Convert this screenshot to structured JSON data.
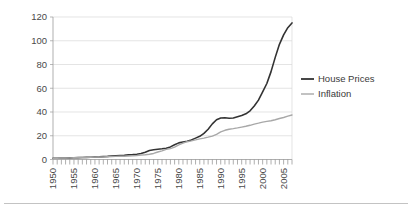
{
  "chart_data": {
    "type": "line",
    "title": "",
    "subtitle": "",
    "xlabel": "",
    "ylabel": "",
    "xlim": [
      1950,
      2007
    ],
    "ylim": [
      0,
      120
    ],
    "grid": true,
    "legend_position": "right",
    "y_ticks": [
      "0",
      "20",
      "40",
      "60",
      "80",
      "100",
      "120"
    ],
    "y_tick_values": [
      0,
      20,
      40,
      60,
      80,
      100,
      120
    ],
    "x_ticks": [
      "1950",
      "1955",
      "1960",
      "1965",
      "1970",
      "1975",
      "1980",
      "1985",
      "1990",
      "1995",
      "2000",
      "2005"
    ],
    "x_tick_values": [
      1950,
      1955,
      1960,
      1965,
      1970,
      1975,
      1980,
      1985,
      1990,
      1995,
      2000,
      2005
    ],
    "x_minor_step": 1,
    "x": [
      1950,
      1951,
      1952,
      1953,
      1954,
      1955,
      1956,
      1957,
      1958,
      1959,
      1960,
      1961,
      1962,
      1963,
      1964,
      1965,
      1966,
      1967,
      1968,
      1969,
      1970,
      1971,
      1972,
      1973,
      1974,
      1975,
      1976,
      1977,
      1978,
      1979,
      1980,
      1981,
      1982,
      1983,
      1984,
      1985,
      1986,
      1987,
      1988,
      1989,
      1990,
      1991,
      1992,
      1993,
      1994,
      1995,
      1996,
      1997,
      1998,
      1999,
      2000,
      2001,
      2002,
      2003,
      2004,
      2005,
      2006,
      2007
    ],
    "series": [
      {
        "name": "House Prices",
        "color": "#333333",
        "width": 1.6,
        "values": [
          1.0,
          1.1,
          1.2,
          1.3,
          1.4,
          1.5,
          1.6,
          1.7,
          1.8,
          1.9,
          2.1,
          2.2,
          2.4,
          2.6,
          2.9,
          3.2,
          3.4,
          3.6,
          3.9,
          4.1,
          4.4,
          5.0,
          6.2,
          7.6,
          8.2,
          8.6,
          9.0,
          9.5,
          10.6,
          12.4,
          14.0,
          14.8,
          15.4,
          16.5,
          18.0,
          19.5,
          22.0,
          25.5,
          30.0,
          33.5,
          35.0,
          35.2,
          34.8,
          35.0,
          36.0,
          37.0,
          38.5,
          41.0,
          45.0,
          50.0,
          57.0,
          64.0,
          74.0,
          86.0,
          97.0,
          105.0,
          111.0,
          115.0
        ]
      },
      {
        "name": "Inflation",
        "color": "#a8a8a8",
        "width": 1.4,
        "values": [
          1.0,
          1.1,
          1.2,
          1.3,
          1.4,
          1.5,
          1.6,
          1.7,
          1.8,
          1.9,
          2.0,
          2.1,
          2.2,
          2.3,
          2.4,
          2.6,
          2.7,
          2.8,
          3.0,
          3.2,
          3.4,
          3.7,
          4.0,
          4.4,
          5.1,
          6.3,
          7.3,
          8.5,
          9.2,
          10.4,
          12.3,
          13.8,
          15.0,
          15.7,
          16.5,
          17.4,
          18.0,
          18.8,
          19.7,
          21.2,
          23.2,
          24.6,
          25.5,
          26.0,
          26.6,
          27.3,
          28.0,
          28.8,
          29.8,
          30.6,
          31.5,
          32.1,
          32.6,
          33.5,
          34.5,
          35.4,
          36.5,
          37.5
        ]
      }
    ],
    "legend": [
      {
        "label": "House Prices",
        "color": "#333333"
      },
      {
        "label": "Inflation",
        "color": "#a8a8a8"
      }
    ]
  }
}
